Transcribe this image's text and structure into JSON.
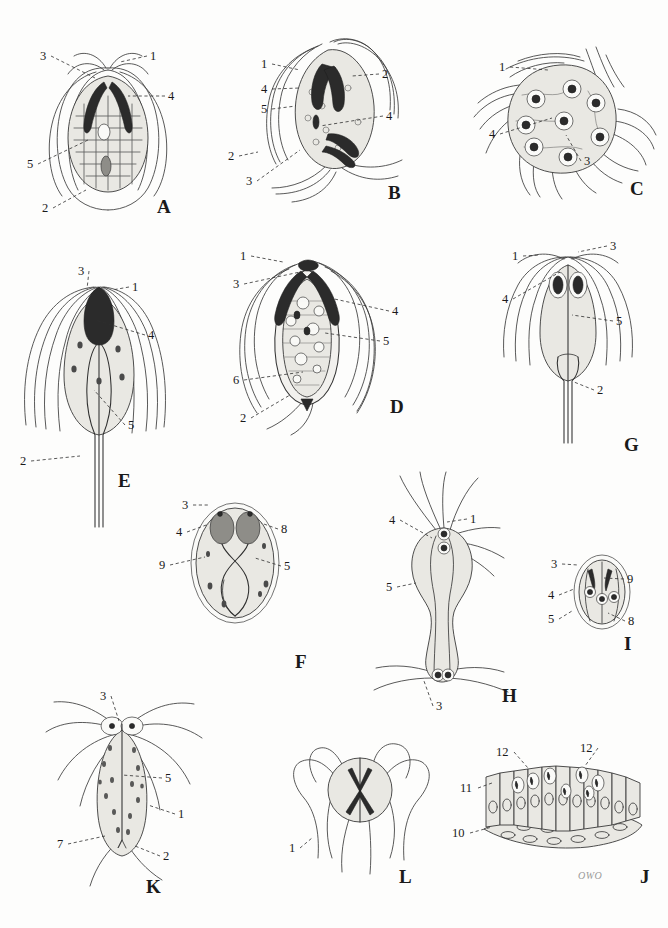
{
  "plate": {
    "title": "Plate of flagellate protozoa — labelled line drawings",
    "background_color": "#fdfdfc",
    "ink_color": "#3b3b3b",
    "signature": "OWO",
    "width": 668,
    "height": 928
  },
  "panels": [
    {
      "id": "A",
      "letter": "A",
      "letter_pos": [
        157,
        196
      ],
      "caption": "rounded pear-shaped binucleate flagellate with paired dark parabasal bodies and reticulate cytoplasm",
      "numbers": [
        {
          "label": "3",
          "x": 40,
          "y": 50,
          "tip": [
            95,
            78
          ]
        },
        {
          "label": "1",
          "x": 150,
          "y": 50,
          "tip": [
            120,
            62
          ]
        },
        {
          "label": "4",
          "x": 168,
          "y": 90,
          "tip": [
            128,
            96
          ]
        },
        {
          "label": "5",
          "x": 27,
          "y": 158,
          "tip": [
            88,
            140
          ]
        },
        {
          "label": "2",
          "x": 42,
          "y": 202,
          "tip": [
            86,
            190
          ]
        }
      ]
    },
    {
      "id": "B",
      "letter": "B",
      "letter_pos": [
        388,
        182
      ],
      "caption": "obliquely oriented dividing form with two sets of dark parabasal bodies and trailing flagella",
      "numbers": [
        {
          "label": "1",
          "x": 261,
          "y": 58,
          "tip": [
            300,
            70
          ]
        },
        {
          "label": "2",
          "x": 382,
          "y": 68,
          "tip": [
            352,
            76
          ]
        },
        {
          "label": "4",
          "x": 261,
          "y": 83,
          "tip": [
            300,
            88
          ]
        },
        {
          "label": "5",
          "x": 261,
          "y": 103,
          "tip": [
            296,
            106
          ]
        },
        {
          "label": "4",
          "x": 386,
          "y": 110,
          "tip": [
            320,
            126
          ]
        },
        {
          "label": "2",
          "x": 228,
          "y": 150,
          "tip": [
            258,
            152
          ]
        },
        {
          "label": "3",
          "x": 246,
          "y": 175,
          "tip": [
            300,
            150
          ]
        }
      ]
    },
    {
      "id": "C",
      "letter": "C",
      "letter_pos": [
        630,
        178
      ],
      "caption": "multinucleate rounded stage bearing numerous ringed nuclei and radiating flagella",
      "numbers": [
        {
          "label": "1",
          "x": 499,
          "y": 61,
          "tip": [
            548,
            70
          ]
        },
        {
          "label": "4",
          "x": 489,
          "y": 128,
          "tip": [
            552,
            118
          ]
        },
        {
          "label": "3",
          "x": 584,
          "y": 155,
          "tip": [
            566,
            135
          ]
        }
      ]
    },
    {
      "id": "D",
      "letter": "D",
      "letter_pos": [
        390,
        396
      ],
      "caption": "pear-shaped flagellate with vacuolated cytoplasm, dark crescent parabasal bodies and posterior axostyle tip",
      "numbers": [
        {
          "label": "1",
          "x": 240,
          "y": 250,
          "tip": [
            283,
            262
          ]
        },
        {
          "label": "3",
          "x": 233,
          "y": 278,
          "tip": [
            300,
            272
          ]
        },
        {
          "label": "4",
          "x": 392,
          "y": 305,
          "tip": [
            330,
            298
          ]
        },
        {
          "label": "5",
          "x": 383,
          "y": 335,
          "tip": [
            325,
            333
          ]
        },
        {
          "label": "6",
          "x": 233,
          "y": 374,
          "tip": [
            303,
            372
          ]
        },
        {
          "label": "2",
          "x": 240,
          "y": 412,
          "tip": [
            290,
            395
          ]
        }
      ]
    },
    {
      "id": "E",
      "letter": "E",
      "letter_pos": [
        118,
        470
      ],
      "caption": "tear-drop flagellate with long trailing flagellum, anterior tuft and dark blepharoplast mass",
      "numbers": [
        {
          "label": "3",
          "x": 78,
          "y": 265,
          "tip": [
            87,
            289
          ]
        },
        {
          "label": "1",
          "x": 132,
          "y": 281,
          "tip": [
            112,
            290
          ]
        },
        {
          "label": "4",
          "x": 148,
          "y": 329,
          "tip": [
            95,
            320
          ]
        },
        {
          "label": "5",
          "x": 128,
          "y": 419,
          "tip": [
            94,
            390
          ]
        },
        {
          "label": "2",
          "x": 20,
          "y": 455,
          "tip": [
            80,
            456
          ]
        }
      ]
    },
    {
      "id": "F",
      "letter": "F",
      "letter_pos": [
        295,
        651
      ],
      "caption": "oval cyst with double wall, two dark bodies and crossed intracystic fibres",
      "numbers": [
        {
          "label": "3",
          "x": 182,
          "y": 499,
          "tip": [
            208,
            505
          ]
        },
        {
          "label": "4",
          "x": 176,
          "y": 526,
          "tip": [
            209,
            524
          ]
        },
        {
          "label": "8",
          "x": 281,
          "y": 523,
          "tip": [
            261,
            523
          ]
        },
        {
          "label": "9",
          "x": 159,
          "y": 559,
          "tip": [
            205,
            557
          ]
        },
        {
          "label": "5",
          "x": 284,
          "y": 560,
          "tip": [
            255,
            558
          ]
        }
      ]
    },
    {
      "id": "G",
      "letter": "G",
      "letter_pos": [
        624,
        434
      ],
      "caption": "slender flagellate with paired anterior dark bodies and a very long posterior flagellum",
      "numbers": [
        {
          "label": "1",
          "x": 512,
          "y": 250,
          "tip": [
            540,
            255
          ]
        },
        {
          "label": "3",
          "x": 610,
          "y": 240,
          "tip": [
            578,
            252
          ]
        },
        {
          "label": "4",
          "x": 502,
          "y": 293,
          "tip": [
            560,
            272
          ]
        },
        {
          "label": "5",
          "x": 616,
          "y": 315,
          "tip": [
            572,
            315
          ]
        },
        {
          "label": "2",
          "x": 597,
          "y": 384,
          "tip": [
            574,
            382
          ]
        }
      ]
    },
    {
      "id": "H",
      "letter": "H",
      "letter_pos": [
        502,
        685
      ],
      "caption": "dumb-bell shaped conjugating pair joined by a narrow cytoplasmic bridge",
      "numbers": [
        {
          "label": "4",
          "x": 389,
          "y": 514,
          "tip": [
            432,
            538
          ]
        },
        {
          "label": "1",
          "x": 470,
          "y": 513,
          "tip": [
            447,
            522
          ]
        },
        {
          "label": "5",
          "x": 386,
          "y": 581,
          "tip": [
            416,
            583
          ]
        },
        {
          "label": "3",
          "x": 436,
          "y": 700,
          "tip": [
            424,
            681
          ]
        }
      ]
    },
    {
      "id": "I",
      "letter": "I",
      "letter_pos": [
        624,
        633
      ],
      "caption": "small oval cyst containing four ringed nuclei and paired dark bodies",
      "numbers": [
        {
          "label": "3",
          "x": 551,
          "y": 558,
          "tip": [
            578,
            565
          ]
        },
        {
          "label": "9",
          "x": 627,
          "y": 573,
          "tip": [
            604,
            578
          ]
        },
        {
          "label": "4",
          "x": 548,
          "y": 589,
          "tip": [
            574,
            589
          ]
        },
        {
          "label": "5",
          "x": 548,
          "y": 613,
          "tip": [
            572,
            611
          ]
        },
        {
          "label": "8",
          "x": 628,
          "y": 615,
          "tip": [
            608,
            613
          ]
        }
      ]
    },
    {
      "id": "J",
      "letter": "J",
      "letter_pos": [
        640,
        866
      ],
      "caption": "section of columnar intestinal epithelium with attached trophozoites and underlying lamina propria",
      "numbers": [
        {
          "label": "12",
          "x": 496,
          "y": 746,
          "tip": [
            528,
            768
          ]
        },
        {
          "label": "12",
          "x": 580,
          "y": 742,
          "tip": [
            585,
            766
          ]
        },
        {
          "label": "11",
          "x": 460,
          "y": 782,
          "tip": [
            492,
            783
          ]
        },
        {
          "label": "10",
          "x": 452,
          "y": 827,
          "tip": [
            492,
            827
          ]
        }
      ]
    },
    {
      "id": "K",
      "letter": "K",
      "letter_pos": [
        146,
        876
      ],
      "caption": "lance-shaped flagellate with granular cytoplasm, axostyle and paired posterior flagella",
      "numbers": [
        {
          "label": "3",
          "x": 100,
          "y": 690,
          "tip": [
            119,
            721
          ]
        },
        {
          "label": "5",
          "x": 165,
          "y": 772,
          "tip": [
            122,
            775
          ]
        },
        {
          "label": "1",
          "x": 178,
          "y": 808,
          "tip": [
            148,
            805
          ]
        },
        {
          "label": "7",
          "x": 57,
          "y": 838,
          "tip": [
            105,
            836
          ]
        },
        {
          "label": "2",
          "x": 163,
          "y": 850,
          "tip": [
            135,
            846
          ]
        }
      ]
    },
    {
      "id": "L",
      "letter": "L",
      "letter_pos": [
        399,
        866
      ],
      "caption": "anterior end detail showing stippled disc and emerging flagellar bundles",
      "numbers": [
        {
          "label": "1",
          "x": 289,
          "y": 842,
          "tip": [
            312,
            838
          ]
        }
      ]
    }
  ],
  "legend_numbers": [
    "1",
    "2",
    "3",
    "4",
    "5",
    "6",
    "7",
    "8",
    "9",
    "10",
    "11",
    "12"
  ]
}
